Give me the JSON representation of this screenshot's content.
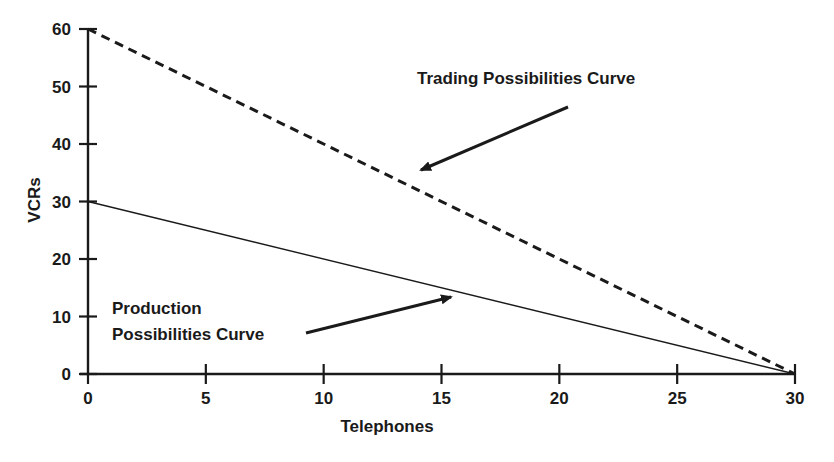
{
  "chart_data": {
    "type": "line",
    "title": "",
    "xlabel": "Telephones",
    "ylabel": "VCRs",
    "xlim": [
      0,
      30
    ],
    "ylim": [
      0,
      60
    ],
    "x_ticks": [
      0,
      5,
      10,
      15,
      20,
      25,
      30
    ],
    "y_ticks": [
      0,
      10,
      20,
      30,
      40,
      50,
      60
    ],
    "x_tick_labels": [
      "0",
      "5",
      "10",
      "15",
      "20",
      "25",
      "30"
    ],
    "y_tick_labels": [
      "0",
      "10",
      "20",
      "30",
      "40",
      "50",
      "60"
    ],
    "grid": false,
    "legend": "none",
    "series": [
      {
        "name": "Trading Possibilities Curve",
        "style": "dashed",
        "x": [
          0,
          30
        ],
        "y": [
          60,
          0
        ]
      },
      {
        "name": "Production Possibilities Curve",
        "style": "solid",
        "x": [
          0,
          30
        ],
        "y": [
          30,
          0
        ]
      }
    ],
    "annotations": [
      {
        "text": "Trading Possibilities Curve",
        "arrow_to": {
          "x": 13.7,
          "y": 34.5
        }
      },
      {
        "text_lines": [
          "Production",
          "Possibilities Curve"
        ],
        "arrow_to": {
          "x": 15.5,
          "y": 13.5
        }
      }
    ]
  },
  "labels": {
    "xlabel": "Telephones",
    "ylabel": "VCRs",
    "trading_annotation": "Trading Possibilities Curve",
    "production_annotation_line1": "Production",
    "production_annotation_line2": "Possibilities Curve"
  },
  "colors": {
    "ink": "#1a1a1a",
    "background": "#ffffff"
  }
}
